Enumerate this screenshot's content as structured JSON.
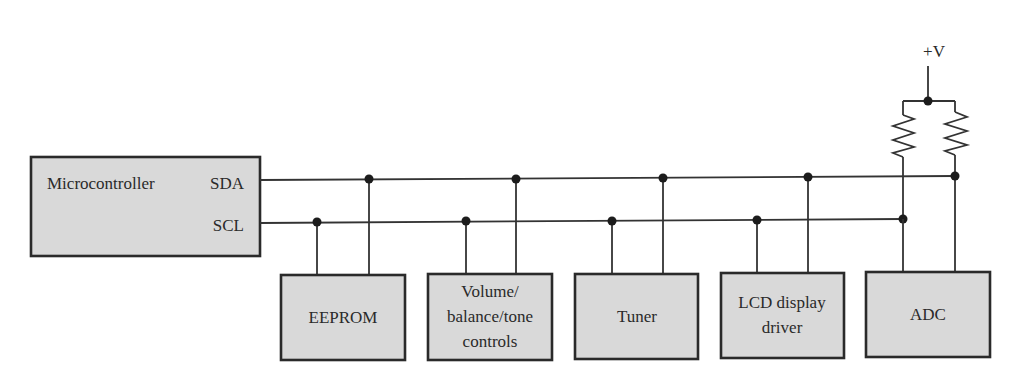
{
  "diagram": {
    "type": "I2C bus block diagram",
    "supply": {
      "label": "+V"
    },
    "buses": [
      {
        "name": "SDA",
        "label": "SDA"
      },
      {
        "name": "SCL",
        "label": "SCL"
      }
    ],
    "master": {
      "label": "Microcontroller",
      "pins": [
        "SDA",
        "SCL"
      ]
    },
    "devices": [
      {
        "id": "eeprom",
        "lines": [
          "EEPROM"
        ]
      },
      {
        "id": "volume",
        "lines": [
          "Volume/",
          "balance/tone",
          "controls"
        ]
      },
      {
        "id": "tuner",
        "lines": [
          "Tuner"
        ]
      },
      {
        "id": "lcd",
        "lines": [
          "LCD display",
          "driver"
        ]
      },
      {
        "id": "adc",
        "lines": [
          "ADC"
        ]
      }
    ],
    "pullups": [
      {
        "id": "r-scl",
        "connects": "SCL"
      },
      {
        "id": "r-sda",
        "connects": "SDA"
      }
    ],
    "colors": {
      "box_fill": "#d9d9d9",
      "stroke": "#2a2a2a",
      "background": "#ffffff"
    }
  }
}
